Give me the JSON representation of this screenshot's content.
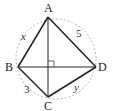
{
  "diagram": {
    "type": "cyclic-quadrilateral",
    "circle": {
      "style": "dashed",
      "color": "#aaaaaa"
    },
    "vertices": [
      {
        "name": "A",
        "label": "A"
      },
      {
        "name": "B",
        "label": "B"
      },
      {
        "name": "C",
        "label": "C"
      },
      {
        "name": "D",
        "label": "D"
      }
    ],
    "sides": [
      {
        "from": "A",
        "to": "B",
        "label": "x"
      },
      {
        "from": "A",
        "to": "D",
        "label": "5"
      },
      {
        "from": "B",
        "to": "C",
        "label": "3"
      },
      {
        "from": "C",
        "to": "D",
        "label": "y"
      }
    ],
    "diagonals": [
      {
        "from": "A",
        "to": "C"
      },
      {
        "from": "B",
        "to": "D"
      }
    ],
    "right_angle_marker": "diagonals intersect at right angle",
    "colors": {
      "lines": "#222222",
      "circle": "#aaaaaa"
    }
  }
}
